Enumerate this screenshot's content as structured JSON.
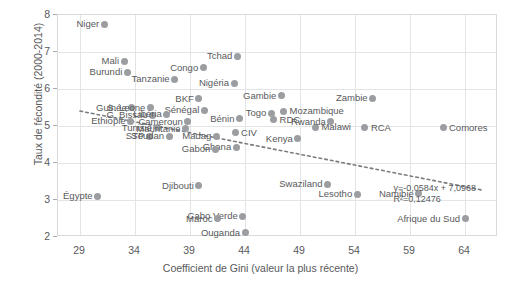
{
  "chart_data": {
    "type": "scatter",
    "title": "",
    "xlabel": "Coefficient de Gini (valeur la plus récente)",
    "ylabel": "Taux de fécondité (2000-2014)",
    "xlim": [
      27,
      67
    ],
    "ylim": [
      2,
      8
    ],
    "xticks": [
      "29",
      "34",
      "39",
      "44",
      "49",
      "54",
      "59",
      "64"
    ],
    "xtick_values": [
      29,
      34,
      39,
      44,
      49,
      54,
      59,
      64
    ],
    "yticks": [
      "2",
      "3",
      "4",
      "5",
      "6",
      "7",
      "8"
    ],
    "ytick_values": [
      2,
      3,
      4,
      5,
      6,
      7,
      8
    ],
    "grid": true,
    "legend": "none",
    "point_color": "#9b9da0",
    "text_color": "#58595b",
    "grid_color": "#e3e4e5",
    "trendline": {
      "style": "dotted",
      "equation": "y=-0,0584x + 7,0968",
      "r2": "R²=0,12476",
      "slope": -0.0584,
      "intercept": 7.0968,
      "x_start": 29.0,
      "x_end": 65.5
    },
    "points": [
      {
        "label": "Niger",
        "x": 31.2,
        "y": 7.75,
        "lp": "r"
      },
      {
        "label": "Mali",
        "x": 33.0,
        "y": 6.75,
        "lp": "r"
      },
      {
        "label": "Burundi",
        "x": 33.3,
        "y": 6.45,
        "lp": "r"
      },
      {
        "label": "Tanzanie",
        "x": 37.6,
        "y": 6.27,
        "lp": "r"
      },
      {
        "label": "Congo",
        "x": 40.2,
        "y": 6.58,
        "lp": "r"
      },
      {
        "label": "Nigéria",
        "x": 43.0,
        "y": 6.15,
        "lp": "r"
      },
      {
        "label": "Tchad",
        "x": 43.3,
        "y": 6.88,
        "lp": "r"
      },
      {
        "label": "Gambie",
        "x": 47.3,
        "y": 5.82,
        "lp": "r"
      },
      {
        "label": "Zambie",
        "x": 55.6,
        "y": 5.75,
        "lp": "r"
      },
      {
        "label": "Guinée",
        "x": 33.7,
        "y": 5.5,
        "lp": "r"
      },
      {
        "label": "S. Leone",
        "x": 35.4,
        "y": 5.5,
        "lp": "r"
      },
      {
        "label": "BKF",
        "x": 39.8,
        "y": 5.73,
        "lp": "r"
      },
      {
        "label": "Sénégal",
        "x": 40.3,
        "y": 5.42,
        "lp": "r"
      },
      {
        "label": "Mozambique",
        "x": 47.5,
        "y": 5.4,
        "lp": "l"
      },
      {
        "label": "G. Bissau",
        "x": 35.6,
        "y": 5.29,
        "lp": "r"
      },
      {
        "label": "Libéria",
        "x": 36.9,
        "y": 5.32,
        "lp": "r"
      },
      {
        "label": "Togo",
        "x": 46.4,
        "y": 5.34,
        "lp": "r"
      },
      {
        "label": "Ethiopie",
        "x": 33.6,
        "y": 5.13,
        "lp": "r"
      },
      {
        "label": "Cameroun",
        "x": 38.8,
        "y": 5.12,
        "lp": "r"
      },
      {
        "label": "RDC",
        "x": 46.6,
        "y": 5.17,
        "lp": "l"
      },
      {
        "label": "Bénin",
        "x": 43.5,
        "y": 5.2,
        "lp": "r"
      },
      {
        "label": "Tunisie",
        "x": 36.0,
        "y": 4.95,
        "lp": "r"
      },
      {
        "label": "Mauritanie",
        "x": 38.6,
        "y": 4.93,
        "lp": "r"
      },
      {
        "label": "Malawi",
        "x": 50.4,
        "y": 4.97,
        "lp": "l"
      },
      {
        "label": "Rwanda",
        "x": 51.8,
        "y": 5.12,
        "lp": "r"
      },
      {
        "label": "RCA",
        "x": 54.9,
        "y": 4.95,
        "lp": "l"
      },
      {
        "label": "Comores",
        "x": 62.0,
        "y": 4.95,
        "lp": "l"
      },
      {
        "label": "CIV",
        "x": 43.1,
        "y": 4.82,
        "lp": "l"
      },
      {
        "label": "STP",
        "x": 35.3,
        "y": 4.72,
        "lp": "r"
      },
      {
        "label": "Soudan",
        "x": 37.1,
        "y": 4.72,
        "lp": "r"
      },
      {
        "label": "Madag",
        "x": 41.4,
        "y": 4.72,
        "lp": "r"
      },
      {
        "label": "Kenya",
        "x": 48.8,
        "y": 4.65,
        "lp": "r"
      },
      {
        "label": "Ghana",
        "x": 43.2,
        "y": 4.42,
        "lp": "r"
      },
      {
        "label": "Gabon",
        "x": 41.3,
        "y": 4.37,
        "lp": "r"
      },
      {
        "label": "Égypte",
        "x": 30.6,
        "y": 3.1,
        "lp": "r"
      },
      {
        "label": "Djibouti",
        "x": 39.8,
        "y": 3.38,
        "lp": "r"
      },
      {
        "label": "Swaziland",
        "x": 51.5,
        "y": 3.42,
        "lp": "r"
      },
      {
        "label": "Lesotho",
        "x": 54.2,
        "y": 3.15,
        "lp": "r"
      },
      {
        "label": "Namibie",
        "x": 59.8,
        "y": 3.17,
        "lp": "r"
      },
      {
        "label": "Cabo Verde",
        "x": 43.8,
        "y": 2.56,
        "lp": "r"
      },
      {
        "label": "Maroc",
        "x": 41.5,
        "y": 2.5,
        "lp": "r"
      },
      {
        "label": "Ouganda",
        "x": 44.0,
        "y": 2.11,
        "lp": "r"
      },
      {
        "label": "Afrique du Sud",
        "x": 64.0,
        "y": 2.5,
        "lp": "r"
      }
    ]
  }
}
